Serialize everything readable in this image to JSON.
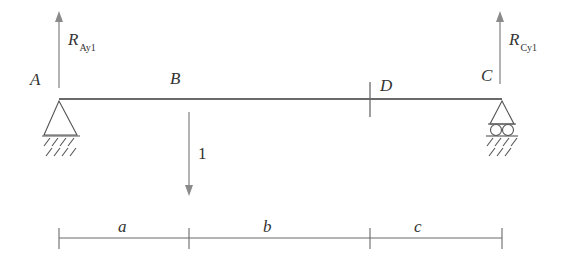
{
  "diagram": {
    "type": "simply-supported-beam-unit-load",
    "points": {
      "A": "A",
      "B": "B",
      "C": "C",
      "D": "D"
    },
    "reactions": {
      "left": {
        "symbol": "R",
        "subscript": "Ay1"
      },
      "right": {
        "symbol": "R",
        "subscript": "Cy1"
      }
    },
    "load": {
      "value": "1"
    },
    "dimensions": {
      "a": "a",
      "b": "b",
      "c": "c"
    },
    "supports": {
      "left": "pin",
      "right": "roller"
    },
    "colors": {
      "line": "#555555",
      "arrow": "#888888",
      "text": "#333333"
    }
  }
}
